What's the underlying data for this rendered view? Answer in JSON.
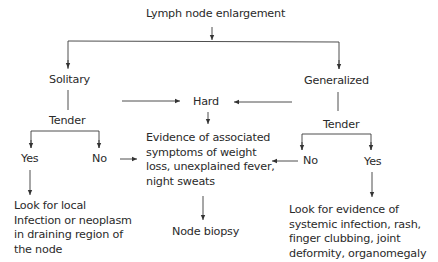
{
  "diagram": {
    "type": "flowchart",
    "title": "Lymph node enlargement",
    "nodes": {
      "root": "Lymph node enlargement",
      "solitary": "Solitary",
      "generalized": "Generalized",
      "hard": "Hard",
      "tender_left": "Tender",
      "tender_right": "Tender",
      "yes_left": "Yes",
      "no_left": "No",
      "no_right": "No",
      "yes_right": "Yes",
      "evidence": "Evidence of associated\nsymptoms of weight\nloss, unexplained fever,\nnight sweats",
      "node_biopsy": "Node biopsy",
      "local": "Look for local\nInfection or neoplasm\nin draining region of\nthe node",
      "systemic": "Look for evidence of\nsystemic infection, rash,\nfinger clubbing, joint\ndeformity, organomegaly"
    },
    "edges": [
      {
        "from": "Lymph node enlargement",
        "to": "Solitary"
      },
      {
        "from": "Lymph node enlargement",
        "to": "Generalized"
      },
      {
        "from": "Solitary",
        "to": "Hard"
      },
      {
        "from": "Solitary",
        "to": "Tender"
      },
      {
        "from": "Generalized",
        "to": "Hard"
      },
      {
        "from": "Generalized",
        "to": "Tender"
      },
      {
        "from": "Hard",
        "to": "Evidence of associated symptoms"
      },
      {
        "from": "Tender (solitary)",
        "to": "Yes"
      },
      {
        "from": "Tender (solitary)",
        "to": "No"
      },
      {
        "from": "Tender (generalized)",
        "to": "No"
      },
      {
        "from": "Tender (generalized)",
        "to": "Yes"
      },
      {
        "from": "No (solitary)",
        "to": "Evidence of associated symptoms"
      },
      {
        "from": "No (generalized)",
        "to": "Evidence of associated symptoms"
      },
      {
        "from": "Yes (solitary)",
        "to": "Look for local infection or neoplasm"
      },
      {
        "from": "Yes (generalized)",
        "to": "Look for evidence of systemic infection"
      },
      {
        "from": "Evidence of associated symptoms",
        "to": "Node biopsy"
      }
    ]
  },
  "colors": {
    "line": "#3a3a3a",
    "text": "#2a2a2a",
    "background": "#ffffff"
  }
}
